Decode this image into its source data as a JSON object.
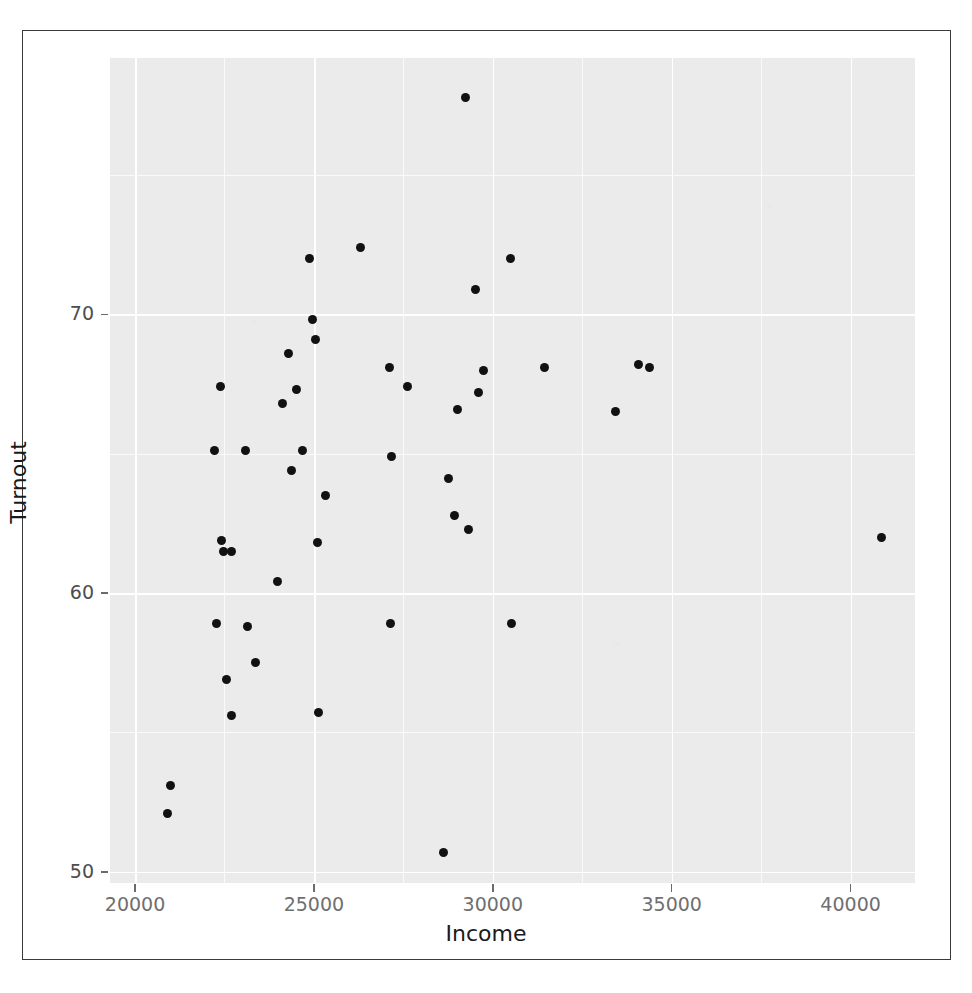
{
  "figure": {
    "background_color": "#ffffff",
    "panel_color": "#ebebeb",
    "grid_color": "#ffffff",
    "point_color": "#111111",
    "axis_text_color": "#4d4d4d",
    "border_color": "#3a3a3a"
  },
  "axes": {
    "x_label": "Income",
    "y_label": "Turnout",
    "x_ticks": [
      "20000",
      "25000",
      "30000",
      "35000",
      "40000"
    ],
    "y_ticks": [
      "70",
      "60",
      "50"
    ]
  },
  "chart_data": {
    "type": "scatter",
    "title": "",
    "subtitle": "",
    "xlabel": "Income",
    "ylabel": "Turnout",
    "xlim": [
      19300,
      41800
    ],
    "ylim": [
      49.6,
      79.2
    ],
    "x_ticks": [
      20000,
      25000,
      30000,
      35000,
      40000
    ],
    "y_ticks": [
      50,
      60,
      70
    ],
    "grid": true,
    "legend": false,
    "legend_position": "none",
    "marker": "filled-circle",
    "n_points": 51,
    "points": [
      {
        "x": 29240,
        "y": 77.8
      },
      {
        "x": 26300,
        "y": 72.4
      },
      {
        "x": 24870,
        "y": 72.0
      },
      {
        "x": 30490,
        "y": 72.0
      },
      {
        "x": 29510,
        "y": 70.9
      },
      {
        "x": 24950,
        "y": 69.8
      },
      {
        "x": 25030,
        "y": 69.1
      },
      {
        "x": 24300,
        "y": 68.6
      },
      {
        "x": 27100,
        "y": 68.1
      },
      {
        "x": 31440,
        "y": 68.1
      },
      {
        "x": 34080,
        "y": 68.2
      },
      {
        "x": 34380,
        "y": 68.1
      },
      {
        "x": 29750,
        "y": 68.0
      },
      {
        "x": 22400,
        "y": 67.4
      },
      {
        "x": 27620,
        "y": 67.4
      },
      {
        "x": 24520,
        "y": 67.3
      },
      {
        "x": 29610,
        "y": 67.2
      },
      {
        "x": 24110,
        "y": 66.8
      },
      {
        "x": 29020,
        "y": 66.6
      },
      {
        "x": 33420,
        "y": 66.5
      },
      {
        "x": 23080,
        "y": 65.1
      },
      {
        "x": 24680,
        "y": 65.1
      },
      {
        "x": 27160,
        "y": 64.9
      },
      {
        "x": 22230,
        "y": 65.1
      },
      {
        "x": 24380,
        "y": 64.4
      },
      {
        "x": 28770,
        "y": 64.1
      },
      {
        "x": 25320,
        "y": 63.5
      },
      {
        "x": 28930,
        "y": 62.8
      },
      {
        "x": 29310,
        "y": 62.3
      },
      {
        "x": 40850,
        "y": 62.0
      },
      {
        "x": 25110,
        "y": 61.8
      },
      {
        "x": 22420,
        "y": 61.9
      },
      {
        "x": 22480,
        "y": 61.5
      },
      {
        "x": 22700,
        "y": 61.5
      },
      {
        "x": 23990,
        "y": 60.4
      },
      {
        "x": 22280,
        "y": 58.9
      },
      {
        "x": 27150,
        "y": 58.9
      },
      {
        "x": 30510,
        "y": 58.9
      },
      {
        "x": 23150,
        "y": 58.8
      },
      {
        "x": 23380,
        "y": 57.5
      },
      {
        "x": 22560,
        "y": 56.9
      },
      {
        "x": 25130,
        "y": 55.7
      },
      {
        "x": 22690,
        "y": 55.6
      },
      {
        "x": 20980,
        "y": 53.1
      },
      {
        "x": 20900,
        "y": 52.1
      },
      {
        "x": 28620,
        "y": 50.7
      }
    ]
  }
}
